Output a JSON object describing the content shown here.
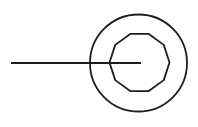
{
  "diagram": {
    "type": "line-to-concentric-circles",
    "canvas": {
      "width": 198,
      "height": 127,
      "background": "#ffffff"
    },
    "stroke_color": "#1e1e1e",
    "line": {
      "x1": 11,
      "y1": 63,
      "x2": 141,
      "y2": 63,
      "stroke_width": 2
    },
    "outer_circle": {
      "cx": 138.5,
      "cy": 63,
      "r": 48.5,
      "stroke_width": 1.8
    },
    "inner_polygon": {
      "cx": 139.5,
      "cy": 62.5,
      "r": 30,
      "sides": 10,
      "stroke_width": 1.8
    }
  }
}
